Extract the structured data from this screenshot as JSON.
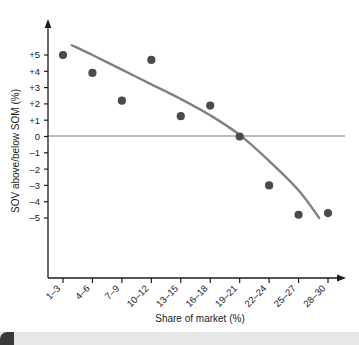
{
  "chart_data": {
    "type": "scatter",
    "title": "",
    "subtitle": "",
    "xlabel": "Share of market (%)",
    "ylabel": "SOV above/below SOM (%)",
    "categories": [
      "1–3",
      "4–6",
      "7–9",
      "10–12",
      "13–15",
      "16–18",
      "19–21",
      "22–24",
      "25–27",
      "28–30"
    ],
    "ytick_labels": [
      "+5",
      "+4",
      "+3",
      "+2",
      "+1",
      "0",
      "–1",
      "–2",
      "–3",
      "–4",
      "–5"
    ],
    "ytick_values": [
      5,
      4,
      3,
      2,
      1,
      0,
      -1,
      -2,
      -3,
      -4,
      -5
    ],
    "ylim": [
      -5.6,
      5.8
    ],
    "xlim": [
      0.3,
      10.9
    ],
    "grid": false,
    "legend": null,
    "zero_line": 0,
    "series": [
      {
        "name": "SOV vs SOM observations",
        "type": "scatter",
        "marker": "filled-circle",
        "color": "#4a4a52",
        "points": [
          {
            "category": "1–3",
            "x": 1,
            "y": 5.0
          },
          {
            "category": "4–6",
            "x": 2,
            "y": 3.9
          },
          {
            "category": "7–9",
            "x": 3,
            "y": 2.2
          },
          {
            "category": "10–12",
            "x": 4,
            "y": 4.7
          },
          {
            "category": "13–15",
            "x": 5,
            "y": 1.25
          },
          {
            "category": "16–18",
            "x": 6,
            "y": 1.9
          },
          {
            "category": "19–21",
            "x": 7,
            "y": 0.0
          },
          {
            "category": "22–24",
            "x": 8,
            "y": -3.0
          },
          {
            "category": "25–27",
            "x": 9,
            "y": -4.8
          },
          {
            "category": "28–30",
            "x": 10,
            "y": -4.7
          }
        ]
      },
      {
        "name": "Fitted trend curve",
        "type": "line",
        "color": "#808088",
        "points": [
          {
            "x": 1.3,
            "y": 5.6
          },
          {
            "x": 2.0,
            "y": 5.0
          },
          {
            "x": 3.0,
            "y": 4.1
          },
          {
            "x": 4.0,
            "y": 3.2
          },
          {
            "x": 5.0,
            "y": 2.3
          },
          {
            "x": 6.0,
            "y": 1.3
          },
          {
            "x": 7.0,
            "y": 0.1
          },
          {
            "x": 8.0,
            "y": -1.5
          },
          {
            "x": 9.0,
            "y": -3.3
          },
          {
            "x": 9.7,
            "y": -5.0
          }
        ]
      }
    ],
    "axis_color": "#1b1b1b",
    "zero_line_color": "#7a7a82",
    "background_color": "#ffffff"
  },
  "figure": {
    "bottom_band_color": "#e8e8e8"
  }
}
